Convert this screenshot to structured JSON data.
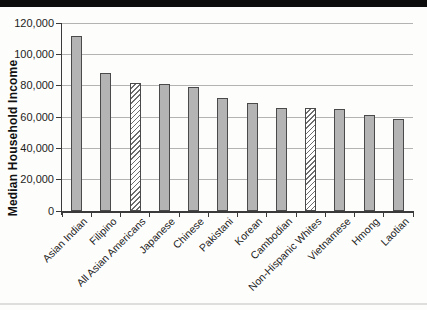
{
  "chart_data": {
    "type": "bar",
    "title": "",
    "xlabel": "",
    "ylabel": "Median Household Income",
    "ylim": [
      0,
      120000
    ],
    "grid": true,
    "legend": "none",
    "yticks": [
      0,
      20000,
      40000,
      60000,
      80000,
      100000,
      120000
    ],
    "ytick_labels": [
      "0",
      "20,000",
      "40,000",
      "60,000",
      "80,000",
      "100,000",
      "120,000"
    ],
    "categories": [
      "Asian Indian",
      "Filipino",
      "All Asian Americans",
      "Japanese",
      "Chinese",
      "Pakistani",
      "Korean",
      "Cambodian",
      "Non-Hispanic Whites",
      "Vietnamese",
      "Hmong",
      "Laotian"
    ],
    "values": [
      112000,
      88000,
      82000,
      81000,
      79000,
      72000,
      69000,
      66000,
      65500,
      65000,
      61000,
      59000
    ],
    "hatched": [
      false,
      false,
      true,
      false,
      false,
      false,
      false,
      false,
      true,
      false,
      false,
      false
    ],
    "colors": {
      "bar_fill": "#b4b4b4",
      "bar_border": "#4a4a4a",
      "hatch_line": "#6e6e6e",
      "hatch_bg": "#ffffff",
      "gridline": "#b3b3b3",
      "axis": "#3a3a3a",
      "text": "#1d1d1d",
      "banner": "#0c0c0c"
    }
  }
}
